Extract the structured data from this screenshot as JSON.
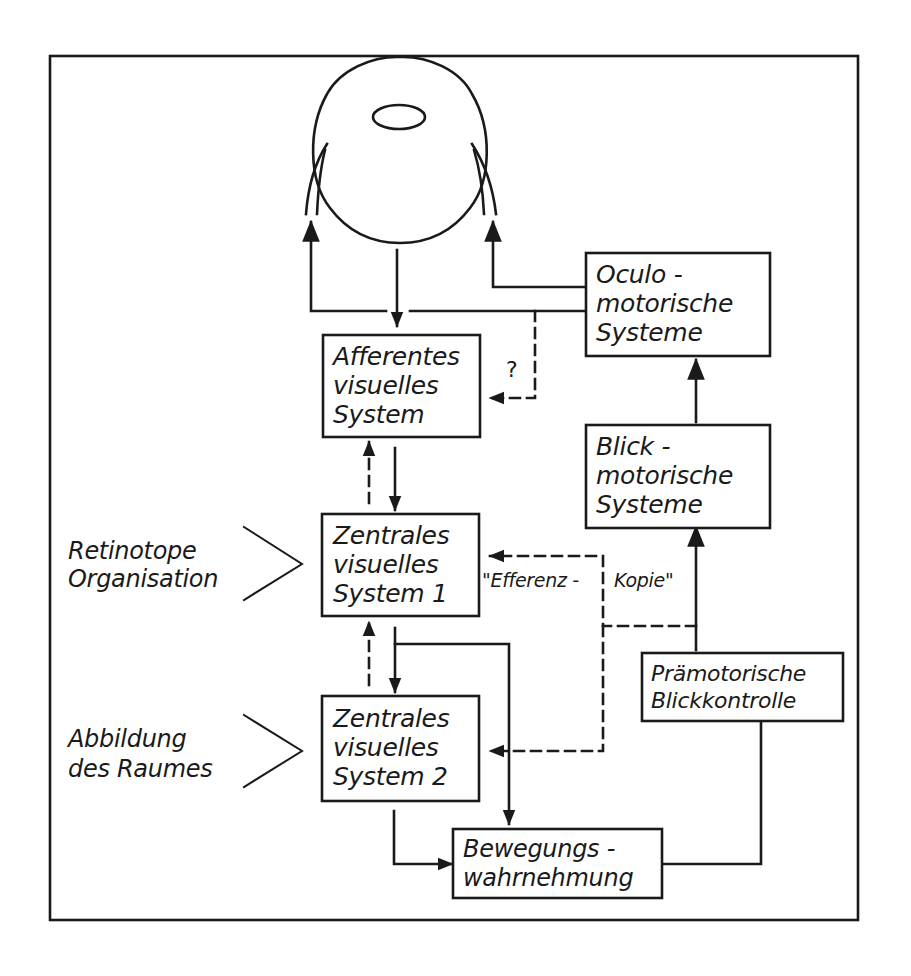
{
  "diagram": {
    "type": "flow diagram",
    "colors": {
      "ink": "#1a1a1a",
      "background": "#ffffff"
    },
    "nodes": {
      "eye": {
        "label": "eye-icon"
      },
      "oculomotor": {
        "lines": [
          "Oculo -",
          "motorische",
          "Systeme"
        ]
      },
      "afferent": {
        "lines": [
          "Afferentes",
          "visuelles",
          "System"
        ]
      },
      "gaze_motor": {
        "lines": [
          "Blick -",
          "motorische",
          "Systeme"
        ]
      },
      "central1": {
        "lines": [
          "Zentrales",
          "visuelles",
          "System 1"
        ]
      },
      "central2": {
        "lines": [
          "Zentrales",
          "visuelles",
          "System 2"
        ]
      },
      "premotor": {
        "lines": [
          "Prämotorische",
          "Blickkontrolle"
        ]
      },
      "motion": {
        "lines": [
          "Bewegungs -",
          "wahrnehmung"
        ]
      }
    },
    "side_labels": {
      "retinotopic": [
        "Retinotope",
        "Organisation"
      ],
      "space": [
        "Abbildung",
        "des  Raumes"
      ]
    },
    "edge_labels": {
      "question": "?",
      "efference_left": "\"Efferenz -",
      "efference_right": "Kopie\""
    },
    "edges": [
      {
        "from": "eye",
        "to": "afferent",
        "style": "solid"
      },
      {
        "from": "oculomotor",
        "to": "eye-left",
        "style": "solid"
      },
      {
        "from": "oculomotor",
        "to": "eye-right",
        "style": "solid"
      },
      {
        "from": "oculomotor",
        "to": "afferent",
        "style": "dashed",
        "label": "?"
      },
      {
        "from": "afferent",
        "to": "central1",
        "style": "solid"
      },
      {
        "from": "central1",
        "to": "afferent",
        "style": "dashed"
      },
      {
        "from": "central1",
        "to": "central2",
        "style": "solid"
      },
      {
        "from": "central2",
        "to": "central1",
        "style": "dashed"
      },
      {
        "from": "central1",
        "to": "motion",
        "style": "solid"
      },
      {
        "from": "central2",
        "to": "motion",
        "style": "solid"
      },
      {
        "from": "motion",
        "to": "premotor",
        "style": "solid"
      },
      {
        "from": "premotor",
        "to": "gaze_motor",
        "style": "solid"
      },
      {
        "from": "gaze_motor",
        "to": "oculomotor",
        "style": "solid"
      },
      {
        "from": "premotor",
        "to": "central1",
        "style": "dashed",
        "label": "\"Efferenz - Kopie\""
      },
      {
        "from": "premotor",
        "to": "central2",
        "style": "dashed"
      }
    ]
  }
}
